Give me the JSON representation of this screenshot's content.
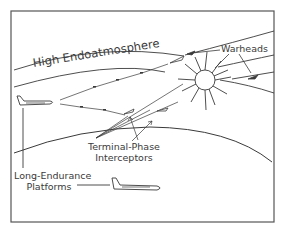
{
  "diagram": {
    "labels": {
      "atmosphere_layer": "High Endoatmosphere",
      "warheads": "Warheads",
      "terminal_interceptors_line1": "Terminal-Phase",
      "terminal_interceptors_line2": "Interceptors",
      "platforms_line1": "Long-Endurance",
      "platforms_line2": "Platforms"
    },
    "elements": [
      {
        "name": "high-endoatmosphere-band",
        "type": "curved-band"
      },
      {
        "name": "earth-horizon",
        "type": "curve"
      },
      {
        "name": "detonation-burst",
        "type": "starburst"
      },
      {
        "name": "warhead",
        "count": 2
      },
      {
        "name": "interceptor-missile",
        "count": 3
      },
      {
        "name": "aircraft-platform",
        "count": 2
      }
    ],
    "colors": {
      "line": "#3a3a3a",
      "frame": "#555555",
      "background": "#ffffff"
    }
  }
}
